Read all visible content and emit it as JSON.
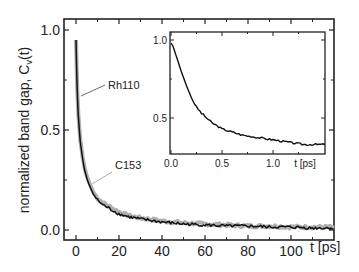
{
  "chart_data": {
    "type": "line",
    "title": "",
    "xlabel": "t [ps]",
    "ylabel": "normalized band gap, C_v(t)",
    "ylabel_main": "normalized band gap, C",
    "ylabel_sub": "v",
    "ylabel_tail": "(t)",
    "xlim": [
      -2.5,
      120
    ],
    "ylim": [
      -0.05,
      1.05
    ],
    "x_ticks": [
      "0",
      "20",
      "40",
      "60",
      "80",
      "100"
    ],
    "y_ticks": [
      "0.0",
      "0.5",
      "1.0"
    ],
    "grid": false,
    "series": [
      {
        "name": "Rh110",
        "color": "#111111",
        "x": [
          0,
          0.5,
          1,
          2,
          3,
          4,
          5,
          6,
          8,
          10,
          12,
          15,
          20,
          25,
          30,
          40,
          50,
          60,
          70,
          80,
          90,
          100,
          110,
          120
        ],
        "values": [
          0.95,
          0.72,
          0.58,
          0.44,
          0.36,
          0.3,
          0.26,
          0.23,
          0.18,
          0.15,
          0.13,
          0.11,
          0.08,
          0.065,
          0.055,
          0.04,
          0.03,
          0.025,
          0.02,
          0.02,
          0.015,
          0.015,
          0.01,
          0.01
        ]
      },
      {
        "name": "C153",
        "color": "#b0b0b0",
        "x": [
          0,
          0.5,
          1,
          2,
          3,
          4,
          5,
          6,
          8,
          10,
          12,
          15,
          20,
          25,
          30,
          40,
          50,
          60,
          70,
          80,
          90,
          100,
          110,
          120
        ],
        "values": [
          0.95,
          0.73,
          0.59,
          0.45,
          0.37,
          0.31,
          0.27,
          0.24,
          0.19,
          0.16,
          0.14,
          0.12,
          0.09,
          0.07,
          0.06,
          0.045,
          0.035,
          0.03,
          0.025,
          0.02,
          0.02,
          0.015,
          0.015,
          0.015
        ]
      }
    ],
    "annotations": [
      {
        "text": "Rh110",
        "points_to": "black curve"
      },
      {
        "text": "C153",
        "points_to": "gray curve"
      }
    ],
    "inset": {
      "type": "line",
      "xlabel": "t [ps]",
      "xlim": [
        0,
        1.5
      ],
      "ylim": [
        0.25,
        1.05
      ],
      "x_ticks": [
        "0.0",
        "0.5",
        "1.0"
      ],
      "y_ticks": [
        "0.5",
        "1.0"
      ],
      "series": [
        {
          "name": "Rh110",
          "color": "#111111",
          "x": [
            0,
            0.02,
            0.05,
            0.1,
            0.15,
            0.2,
            0.25,
            0.3,
            0.4,
            0.5,
            0.6,
            0.7,
            0.8,
            0.9,
            1.0,
            1.1,
            1.2,
            1.3,
            1.4,
            1.5
          ],
          "values": [
            0.98,
            0.96,
            0.9,
            0.8,
            0.71,
            0.63,
            0.57,
            0.53,
            0.47,
            0.43,
            0.41,
            0.39,
            0.38,
            0.37,
            0.36,
            0.35,
            0.34,
            0.33,
            0.33,
            0.33
          ]
        }
      ]
    }
  }
}
